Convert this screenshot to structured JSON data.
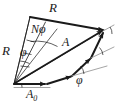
{
  "figure": {
    "type": "vector-phasor-diagram",
    "stroke_color": "#1a1a1a",
    "thin_stroke_color": "#8a8a8a",
    "background": "#ffffff",
    "labels": {
      "R_top": "R",
      "R_left": "R",
      "N_phi": "Nφ",
      "A": "A",
      "A0_main": "A",
      "A0_sub": "0",
      "phi_left": "φ",
      "phi_bottom": "φ"
    },
    "geometry": {
      "center_C": [
        14,
        84
      ],
      "circle_radius_R": 78,
      "vertices": {
        "origin": [
          14,
          84
        ],
        "first_step_end": [
          46,
          84
        ],
        "second_step_end": [
          72,
          76
        ],
        "third_step_end": [
          90,
          58
        ],
        "apex_top_right": [
          104,
          30
        ],
        "apex_top_left": [
          30,
          17
        ]
      },
      "angles": {
        "phi_deg": 21,
        "N": 4,
        "N_phi_deg": 84
      }
    }
  }
}
